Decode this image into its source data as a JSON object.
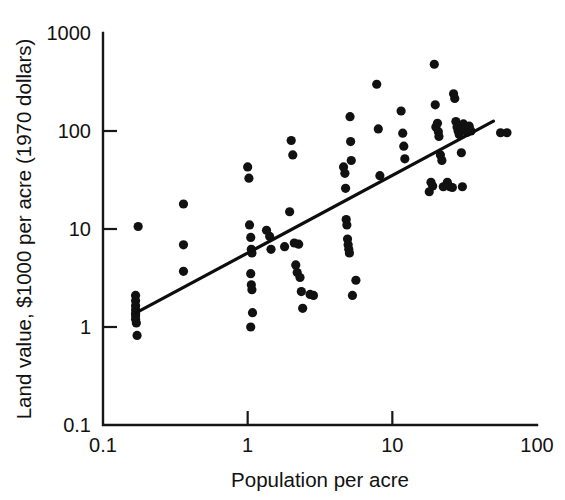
{
  "chart_data": {
    "type": "scatter",
    "title": "",
    "xlabel": "Population per acre",
    "ylabel": "Land value, $1000 per acre (1970 dollars)",
    "xscale": "log",
    "yscale": "log",
    "xlim": [
      0.1,
      100
    ],
    "ylim": [
      0.1,
      1000
    ],
    "grid": false,
    "legend": null,
    "xticklabels": [
      "0.1",
      "1",
      "10",
      "100"
    ],
    "xtickvalues": [
      0.1,
      1,
      10,
      100
    ],
    "yticklabels": [
      "0.1",
      "1",
      "10",
      "100",
      "1000"
    ],
    "ytickvalues": [
      0.1,
      1,
      10,
      100,
      1000
    ],
    "series": [
      {
        "name": "Urban land value observations",
        "marker": "filled-circle",
        "color": "#111111",
        "points": [
          [
            0.168,
            2.1
          ],
          [
            0.168,
            1.85
          ],
          [
            0.168,
            1.65
          ],
          [
            0.168,
            1.5
          ],
          [
            0.168,
            1.38
          ],
          [
            0.168,
            1.3
          ],
          [
            0.168,
            1.2
          ],
          [
            0.17,
            1.1
          ],
          [
            0.172,
            0.82
          ],
          [
            0.175,
            10.6
          ],
          [
            0.36,
            18.0
          ],
          [
            0.36,
            6.9
          ],
          [
            0.36,
            3.7
          ],
          [
            1.0,
            43.0
          ],
          [
            1.02,
            33.0
          ],
          [
            1.03,
            11.0
          ],
          [
            1.05,
            8.2
          ],
          [
            1.06,
            6.2
          ],
          [
            1.07,
            5.7
          ],
          [
            1.05,
            3.5
          ],
          [
            1.06,
            2.7
          ],
          [
            1.07,
            2.4
          ],
          [
            1.08,
            1.4
          ],
          [
            1.05,
            1.0
          ],
          [
            1.35,
            9.7
          ],
          [
            1.42,
            8.4
          ],
          [
            1.45,
            6.2
          ],
          [
            1.8,
            6.6
          ],
          [
            1.95,
            15.0
          ],
          [
            2.0,
            80.0
          ],
          [
            2.05,
            57.0
          ],
          [
            2.1,
            7.2
          ],
          [
            2.15,
            4.3
          ],
          [
            2.2,
            3.6
          ],
          [
            2.25,
            7.0
          ],
          [
            2.3,
            3.2
          ],
          [
            2.35,
            2.3
          ],
          [
            2.4,
            1.55
          ],
          [
            2.7,
            2.15
          ],
          [
            2.85,
            2.1
          ],
          [
            4.6,
            43.0
          ],
          [
            4.7,
            37.0
          ],
          [
            4.75,
            26.0
          ],
          [
            4.8,
            12.5
          ],
          [
            4.85,
            11.0
          ],
          [
            4.9,
            7.9
          ],
          [
            4.95,
            6.9
          ],
          [
            5.0,
            6.2
          ],
          [
            5.05,
            5.7
          ],
          [
            5.1,
            140.0
          ],
          [
            5.15,
            78.0
          ],
          [
            5.2,
            50.0
          ],
          [
            5.3,
            2.1
          ],
          [
            5.6,
            3.0
          ],
          [
            7.8,
            300.0
          ],
          [
            8.0,
            105.0
          ],
          [
            8.2,
            35.0
          ],
          [
            11.5,
            160.0
          ],
          [
            11.8,
            95.0
          ],
          [
            12.0,
            70.0
          ],
          [
            12.2,
            52.0
          ],
          [
            18.0,
            24.0
          ],
          [
            18.5,
            30.0
          ],
          [
            19.0,
            27.5
          ],
          [
            19.5,
            480.0
          ],
          [
            19.8,
            185.0
          ],
          [
            20.0,
            110.0
          ],
          [
            20.5,
            120.0
          ],
          [
            20.8,
            98.0
          ],
          [
            21.0,
            88.0
          ],
          [
            21.5,
            57.0
          ],
          [
            22.0,
            50.0
          ],
          [
            22.5,
            27.0
          ],
          [
            24.0,
            30.0
          ],
          [
            25.0,
            27.0
          ],
          [
            26.0,
            26.5
          ],
          [
            26.5,
            240.0
          ],
          [
            27.0,
            215.0
          ],
          [
            27.5,
            125.0
          ],
          [
            28.0,
            110.0
          ],
          [
            28.5,
            100.0
          ],
          [
            29.0,
            92.0
          ],
          [
            30.0,
            60.0
          ],
          [
            30.5,
            27.0
          ],
          [
            31.0,
            118.0
          ],
          [
            32.0,
            105.0
          ],
          [
            33.0,
            97.0
          ],
          [
            34.0,
            112.0
          ],
          [
            35.0,
            100.0
          ],
          [
            56.0,
            96.0
          ],
          [
            62.0,
            96.0
          ]
        ]
      }
    ],
    "trendline": {
      "name": "regression-fit",
      "x_start": 0.17,
      "y_start": 1.4,
      "x_end": 50.0,
      "y_end": 126.0
    }
  },
  "colors": {
    "marker": "#111111",
    "axis": "#161616",
    "trendline": "#0d0d0d",
    "background": "#ffffff"
  }
}
